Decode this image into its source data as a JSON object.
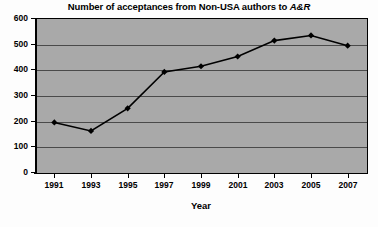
{
  "chart_data": {
    "type": "line",
    "title": "Number of acceptances from Non-USA authors to A&R",
    "title_parts": {
      "plain": "Number of acceptances from Non-USA authors to ",
      "italic": "A&R"
    },
    "xlabel": "Year",
    "ylabel": "",
    "categories": [
      "1991",
      "1993",
      "1995",
      "1997",
      "1999",
      "2001",
      "2003",
      "2005",
      "2007"
    ],
    "x": [
      1991,
      1993,
      1995,
      1997,
      1999,
      2001,
      2003,
      2005,
      2007
    ],
    "values": [
      193,
      160,
      248,
      390,
      412,
      450,
      512,
      532,
      492
    ],
    "series": [
      {
        "name": "Acceptances",
        "values": [
          193,
          160,
          248,
          390,
          412,
          450,
          512,
          532,
          492
        ]
      }
    ],
    "ylim": [
      0,
      600
    ],
    "yticks": [
      0,
      100,
      200,
      300,
      400,
      500,
      600
    ],
    "ytick_labels": [
      "0",
      "100",
      "200",
      "300",
      "400",
      "500",
      "600"
    ],
    "grid": true,
    "grid_axis": "y",
    "legend": false,
    "legend_position": "none",
    "marker": "diamond",
    "colors": {
      "line": "#000000",
      "marker": "#000000",
      "plot_background": "#a9a9a9",
      "gridline": "#4a4a4a",
      "axis": "#000000",
      "figure_background": "#fdfdfd",
      "text": "#000000"
    }
  }
}
